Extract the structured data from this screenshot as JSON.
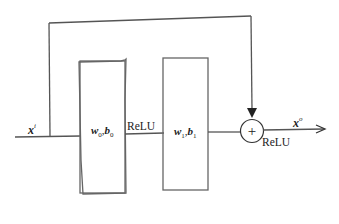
{
  "diagram": {
    "input": {
      "symbol": "x",
      "superscript": "i"
    },
    "output": {
      "symbol": "x",
      "superscript": "o"
    },
    "block0": {
      "w": "w",
      "w_sub": "0",
      "sep": ",",
      "b": "b",
      "b_sub": "0"
    },
    "block1": {
      "w": "w",
      "w_sub": "1",
      "sep": ",",
      "b": "b",
      "b_sub": "1"
    },
    "activation_between": "ReLU",
    "activation_after_sum": "ReLU",
    "sum_symbol": "+",
    "stroke_color": "#555555"
  }
}
